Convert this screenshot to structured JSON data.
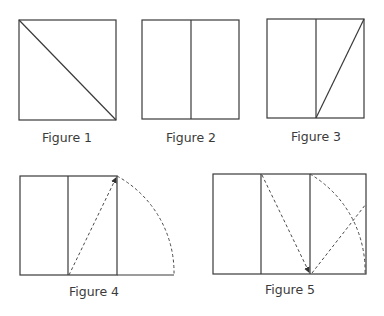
{
  "figures": [
    {
      "id": 1,
      "label": "Figure 1",
      "description": "Square with diagonal from top-left to bottom-right"
    },
    {
      "id": 2,
      "label": "Figure 2",
      "description": "Square divided in half by vertical line"
    },
    {
      "id": 3,
      "label": "Figure 3",
      "description": "Square halved, diagonal of right half from bottom-left to top-right"
    },
    {
      "id": 4,
      "label": "Figure 4",
      "description": "Half-square diagonal rotated as dashed arc to extend baseline"
    },
    {
      "id": 5,
      "label": "Figure 5",
      "description": "Golden rectangle with dashed arcs and diagonals"
    }
  ],
  "colors": {
    "stroke": "#3a3a3a",
    "dashed": "#4a4a4a",
    "background": "#ffffff"
  }
}
